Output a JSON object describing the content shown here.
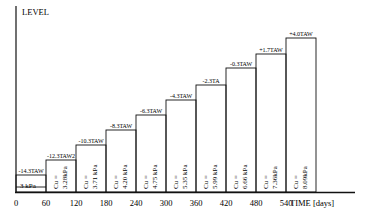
{
  "chart_data": {
    "type": "step",
    "title": "",
    "ylabel": "LEVEL",
    "xlabel": "TIME [days]",
    "x_ticks": [
      "0",
      "60",
      "120",
      "180",
      "240",
      "300",
      "360",
      "420",
      "480",
      "540"
    ],
    "steps": [
      {
        "start": 0,
        "end": 60,
        "level_label": "-14.3TAW",
        "cu_label": "3 kPa",
        "cu_line1": "",
        "cu_line2": "3 kPa"
      },
      {
        "start": 60,
        "end": 120,
        "level_label": "-12.3TAW2",
        "cu_label": "Cu = 3.28kPa",
        "cu_line1": "Cu =",
        "cu_line2": "3.28kPa"
      },
      {
        "start": 120,
        "end": 180,
        "level_label": "-10.3TAW",
        "cu_label": "Cu = 3.71 kPa",
        "cu_line1": "Cu =",
        "cu_line2": "3.71 kPa"
      },
      {
        "start": 180,
        "end": 240,
        "level_label": "-8.3TAW",
        "cu_label": "Cu = 4.20 kPa",
        "cu_line1": "Cu =",
        "cu_line2": "4.20 kPa"
      },
      {
        "start": 240,
        "end": 300,
        "level_label": "-6.3TAW",
        "cu_label": "Cu = 4.75 kPa",
        "cu_line1": "Cu =",
        "cu_line2": "4.75 kPa"
      },
      {
        "start": 300,
        "end": 360,
        "level_label": "-4.3TAW",
        "cu_label": "Cu = 5.35 kPa",
        "cu_line1": "Cu =",
        "cu_line2": "5.35 kPa"
      },
      {
        "start": 360,
        "end": 420,
        "level_label": "-2.3TA",
        "cu_label": "Cu = 5.99 kPa",
        "cu_line1": "Cu =",
        "cu_line2": "5.99 kPa"
      },
      {
        "start": 420,
        "end": 480,
        "level_label": "-0.3TAW",
        "cu_label": "Cu = 6.66 kPa",
        "cu_line1": "Cu =",
        "cu_line2": "6.66 kPa"
      },
      {
        "start": 480,
        "end": 540,
        "level_label": "+1.7TAW",
        "cu_label": "Cu = 7.36kPa",
        "cu_line1": "Cu =",
        "cu_line2": "7.36kPa"
      },
      {
        "start": 540,
        "end": 600,
        "level_label": "+4.0TAW",
        "cu_label": "Cu = 8.09kPa",
        "cu_line1": "Cu =",
        "cu_line2": "8.09kPa"
      }
    ],
    "levels_TAW": [
      -14.3,
      -12.3,
      -10.3,
      -8.3,
      -6.3,
      -4.3,
      -2.3,
      -0.3,
      1.7,
      4.0
    ],
    "cu_kPa": [
      3.0,
      3.28,
      3.71,
      4.2,
      4.75,
      5.35,
      5.99,
      6.66,
      7.36,
      8.09
    ],
    "grid": false,
    "legend": null
  },
  "axes": {
    "y_label": "LEVEL",
    "x_label": "TIME [days]"
  }
}
